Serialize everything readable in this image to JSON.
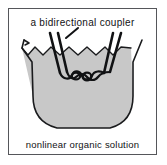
{
  "figure": {
    "title_label": "a bidirectional coupler",
    "bottom_label": "nonlinear organic solution",
    "frame_color": "#55565a",
    "background_color": "#ffffff",
    "ink_color": "#111214",
    "liquid_fill_color": "#c8c8c8",
    "liquid_outline_color": "#1a1b1d",
    "fiber_color": "#111214"
  },
  "diagram_data": {
    "type": "schematic-illustration",
    "subject": "fiber optic bidirectional coupler immersed in nonlinear organic solution",
    "elements": [
      {
        "name": "container",
        "description": "open beaker with rounded U-shaped bottom and flared rim",
        "fill": "#c8c8c8"
      },
      {
        "name": "liquid-surface",
        "description": "wavy scalloped meniscus line across the top of the liquid",
        "scallop_count": 6
      },
      {
        "name": "fiber-pair-left",
        "description": "two parallel optical fibers descending from upper left into liquid",
        "fiber_count": 2
      },
      {
        "name": "fiber-pair-right",
        "description": "two parallel optical fibers descending from upper right into liquid",
        "fiber_count": 2
      },
      {
        "name": "coupler-knot",
        "description": "twisted/braided fused region where the fiber pairs interlace",
        "loop_count": 3
      },
      {
        "name": "leader-line",
        "description": "short diagonal pointer from the label toward the coupler region"
      }
    ]
  }
}
